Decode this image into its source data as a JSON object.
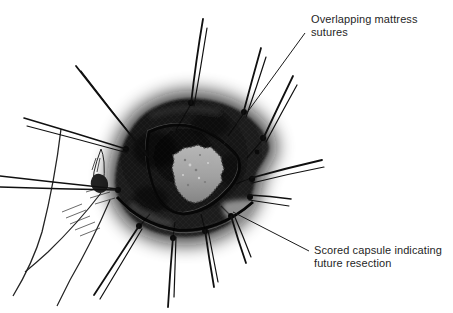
{
  "figure": {
    "background_color": "#ffffff",
    "ink_color": "#1a1a1a",
    "organ_color": "#161616",
    "cut_surface_color": "#a9a9a9"
  },
  "annotations": {
    "top": {
      "label": "Overlapping mattress sutures"
    },
    "bottom": {
      "label": "Scored capsule indicating future resection"
    }
  }
}
